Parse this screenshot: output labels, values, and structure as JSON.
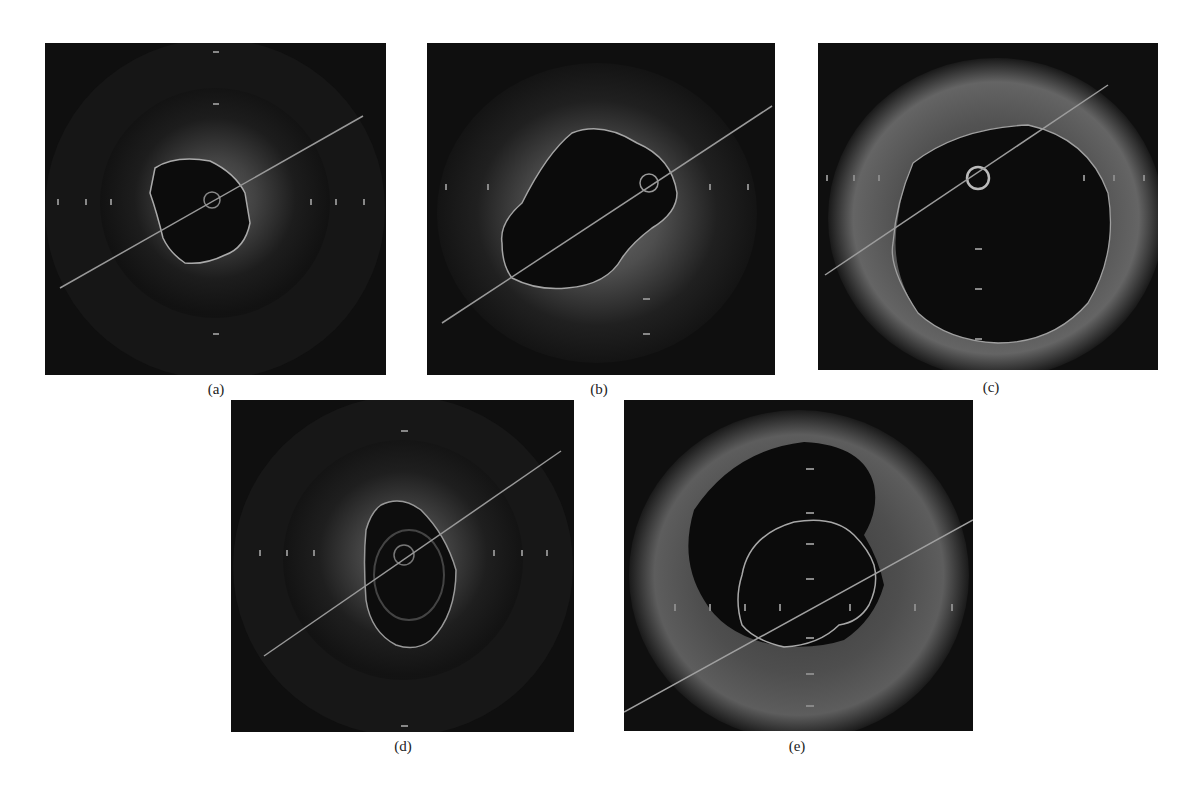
{
  "figure": {
    "panels": [
      {
        "id": "a",
        "label": "(a)",
        "description": "OCT cross-section, small irregular lumen with contour, guidewire artifact"
      },
      {
        "id": "b",
        "label": "(b)",
        "description": "OCT cross-section, elongated lumen with contour"
      },
      {
        "id": "c",
        "label": "(c)",
        "description": "OCT cross-section, large lumen with contour and catheter ring"
      },
      {
        "id": "d",
        "label": "(d)",
        "description": "OCT cross-section, oval lumen with contour"
      },
      {
        "id": "e",
        "label": "(e)",
        "description": "OCT cross-section, large lumen with inner segmented contour"
      }
    ]
  },
  "colors": {
    "background": "#ffffff",
    "image_bg": "#0f0f0f",
    "tissue": "#8a8a8a",
    "contour": "#b8b8b8",
    "caption": "#222222"
  }
}
